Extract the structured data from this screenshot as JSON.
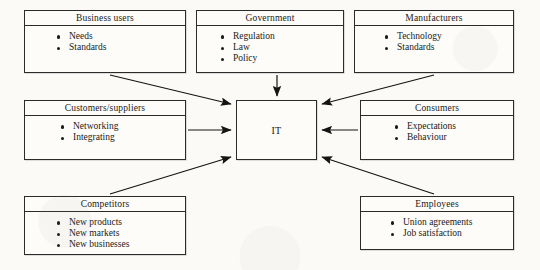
{
  "diagram": {
    "center": {
      "label": "IT",
      "name": "it-core-box"
    },
    "boxes": [
      {
        "id": "business",
        "title": "Business users",
        "items": [
          "Needs",
          "Standards"
        ]
      },
      {
        "id": "government",
        "title": "Government",
        "items": [
          "Regulation",
          "Law",
          "Policy"
        ]
      },
      {
        "id": "manufacturers",
        "title": "Manufacturers",
        "items": [
          "Technology",
          "Standards"
        ]
      },
      {
        "id": "customers",
        "title": "Customers/suppliers",
        "items": [
          "Networking",
          "Integrating"
        ]
      },
      {
        "id": "consumers",
        "title": "Consumers",
        "items": [
          "Expectations",
          "Behaviour"
        ]
      },
      {
        "id": "competitors",
        "title": "Competitors",
        "items": [
          "New products",
          "New markets",
          "New businesses"
        ]
      },
      {
        "id": "employees",
        "title": "Employees",
        "items": [
          "Union agreements",
          "Job satisfaction"
        ]
      }
    ],
    "arrows": [
      {
        "from": "business",
        "to": "it",
        "style": "diagonal"
      },
      {
        "from": "government",
        "to": "it",
        "style": "vertical"
      },
      {
        "from": "manufacturers",
        "to": "it",
        "style": "diagonal"
      },
      {
        "from": "customers",
        "to": "it",
        "style": "horizontal"
      },
      {
        "from": "consumers",
        "to": "it",
        "style": "horizontal"
      },
      {
        "from": "competitors",
        "to": "it",
        "style": "diagonal"
      },
      {
        "from": "employees",
        "to": "it",
        "style": "diagonal"
      }
    ],
    "colors": {
      "stroke": "#2b2b2b",
      "paper": "#fbfaf7",
      "box_fill": "#fdfcf9",
      "text": "#1a1a1a"
    }
  }
}
